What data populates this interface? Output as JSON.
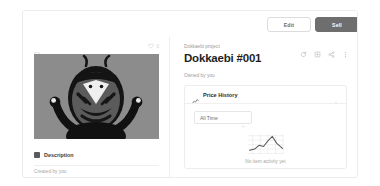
{
  "toolbar": {
    "edit_label": "Edit",
    "sell_label": "Sell"
  },
  "media": {
    "expand_icon": "expand-icon",
    "favorite_icon": "heart-icon",
    "favorite_count": "0",
    "artwork_alt": "Dokkaebi creature illustration",
    "artwork_bg": "#8c8c8c",
    "artwork_fg": "#1b1b1b"
  },
  "description": {
    "icon": "description-icon",
    "label": "Description",
    "created_by": "Created by you"
  },
  "item": {
    "collection": "Dokkaebi project",
    "title": "Dokkaebi #001",
    "owner": "Owned by you"
  },
  "actions": [
    {
      "name": "refresh-icon",
      "title": "Refresh metadata"
    },
    {
      "name": "view-icon",
      "title": "View"
    },
    {
      "name": "share-icon",
      "title": "Share"
    },
    {
      "name": "more-icon",
      "title": "More"
    }
  ],
  "price_history": {
    "icon": "activity-chart-icon",
    "title": "Price History",
    "collapse_icon": "chevron-up-icon",
    "range_value": "All Time",
    "range_chevron": "chevron-down-icon",
    "empty_icon": "line-chart-icon",
    "empty_text": "No item activity yet"
  },
  "colors": {
    "accent_dark": "#6e6e6e",
    "border": "#ececec",
    "text_primary": "#1f1f1f",
    "text_muted": "#9a9a9a",
    "page_bg": "#ffffff"
  }
}
